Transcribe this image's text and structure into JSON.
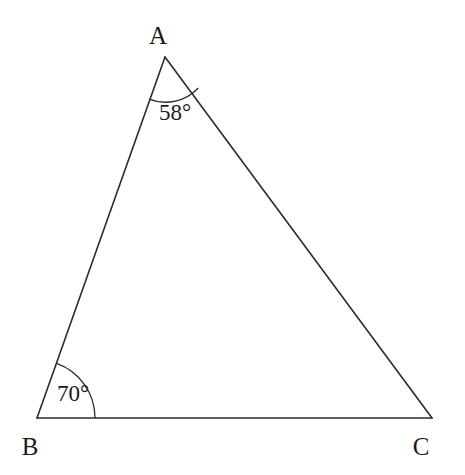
{
  "figure": {
    "type": "triangle-geometry-diagram",
    "background_color": "#ffffff",
    "line_color": "#2b2b2b",
    "text_color": "#1a1a1a"
  },
  "vertices": [
    {
      "name": "A",
      "label": "A",
      "x": 165,
      "y": 57,
      "label_x": 158,
      "label_y": 44
    },
    {
      "name": "B",
      "label": "B",
      "x": 37,
      "y": 418,
      "label_x": 30,
      "label_y": 455
    },
    {
      "name": "C",
      "label": "C",
      "x": 432,
      "y": 418,
      "label_x": 421,
      "label_y": 455
    }
  ],
  "sides": [
    {
      "name": "AB",
      "from": "A",
      "to": "B",
      "path": "M 165 57 L 37 418"
    },
    {
      "name": "AC",
      "from": "A",
      "to": "C",
      "path": "M 165 57 L 432 418"
    },
    {
      "name": "BC",
      "from": "B",
      "to": "C",
      "path": "M 37 418 L 432 418"
    }
  ],
  "angles": [
    {
      "at_vertex": "A",
      "value": 58,
      "label": "58°",
      "arc_radius": 45,
      "arc_path": "M 149.04 99.13 A 45 45 0 0 0 198.29 87.99",
      "label_x": 175,
      "label_y": 120
    },
    {
      "at_vertex": "B",
      "value": 70,
      "label": "70°",
      "arc_radius": 58,
      "arc_path": "M 56.73 363.41 A 58 58 0 0 1 95 418",
      "label_x": 73,
      "label_y": 401
    }
  ],
  "unlabeled_angles": [
    {
      "at_vertex": "C"
    }
  ]
}
